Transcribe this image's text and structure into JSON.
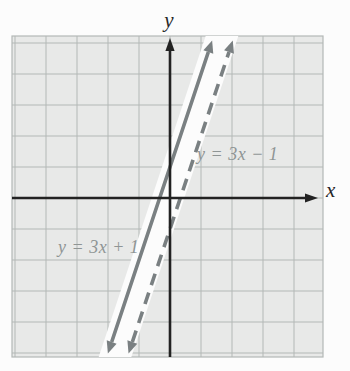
{
  "chart_data": {
    "type": "line",
    "xlabel": "x",
    "ylabel": "y",
    "grid": true,
    "xlim": [
      -5,
      5
    ],
    "ylim": [
      -5,
      5
    ],
    "units_per_gridline": 1,
    "series": [
      {
        "name": "y = 3x + 1",
        "equation": "y = 3x + 1",
        "slope": 3,
        "intercept": 1,
        "style": "solid",
        "color": "#7a8082",
        "label_x": 58,
        "label_y": 253
      },
      {
        "name": "y = 3x − 1",
        "equation": "y = 3x − 1",
        "slope": 3,
        "intercept": -1,
        "style": "dashed",
        "color": "#7a8082",
        "label_x": 197,
        "label_y": 160
      }
    ],
    "region": {
      "description": "Strip between the two parallel lines is unshaded (white); rest of grid is shaded gray",
      "between_lines_shaded": false
    },
    "colors": {
      "grid_fill": "#e8e9e8",
      "grid_line": "#b3b8b6",
      "axis": "#222222",
      "line": "#7a8082",
      "equation_label": "#8f9595",
      "strip_fill": "#fcfcfc",
      "page_background": "#fcfcfc"
    }
  }
}
